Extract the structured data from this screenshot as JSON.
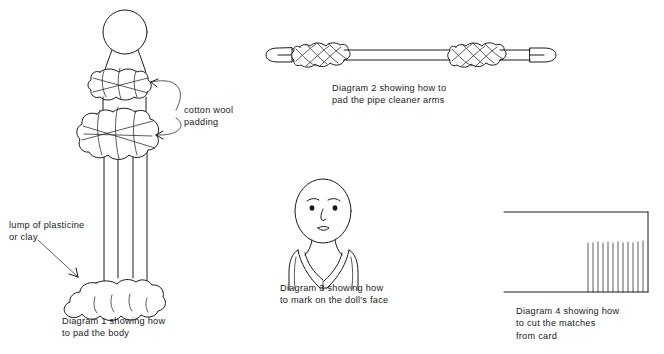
{
  "page": {
    "background_color": "#ffffff",
    "ink_color": "#1a1a1a",
    "width": 664,
    "height": 354
  },
  "annotations": {
    "cotton_wool": {
      "line1": "cotton wool",
      "line2": "padding"
    },
    "plasticine": {
      "line1": "lump of plasticine",
      "line2": "or clay"
    }
  },
  "diagrams": [
    {
      "id": "diagram-1",
      "number": "1",
      "caption_line1": "Diagram 1 showing how",
      "caption_line2": "to pad the body",
      "caption_line3": "",
      "subject": "doll body on sticks with cotton wool padding and plasticine base"
    },
    {
      "id": "diagram-2",
      "number": "2",
      "caption_line1": "Diagram 2 showing how to",
      "caption_line2": "pad the pipe cleaner arms",
      "caption_line3": "",
      "subject": "pipe cleaner with wool wrapped at both ends"
    },
    {
      "id": "diagram-3",
      "number": "3",
      "caption_line1": "Diagram 3 showing how",
      "caption_line2": "to mark on the doll's face",
      "caption_line3": "",
      "subject": "dolls head with face features and kimono collar"
    },
    {
      "id": "diagram-4",
      "number": "4",
      "caption_line1": "Diagram 4 showing how",
      "caption_line2": "to cut the matches",
      "caption_line3": "from card",
      "subject": "rectangular card with comb cuts for matchsticks"
    }
  ]
}
